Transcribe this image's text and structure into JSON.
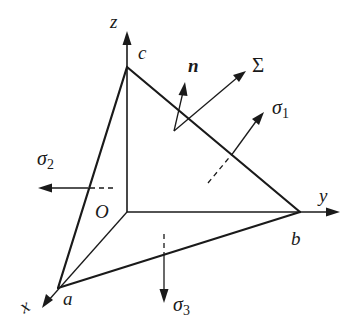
{
  "diagram": {
    "axes": {
      "x": "x",
      "y": "y",
      "z": "z",
      "origin": "O"
    },
    "vertices": {
      "a": "a",
      "b": "b",
      "c": "c"
    },
    "normal_label": "n",
    "plane_label": "Σ",
    "stresses": [
      {
        "symbol": "σ",
        "subscript": "1",
        "direction": "normal to plane abc, outward"
      },
      {
        "symbol": "σ",
        "subscript": "2",
        "direction": "negative y-side, pointing left"
      },
      {
        "symbol": "σ",
        "subscript": "3",
        "direction": "downward"
      }
    ],
    "colors": {
      "ink": "#1a1a1a",
      "background": "#ffffff"
    }
  }
}
